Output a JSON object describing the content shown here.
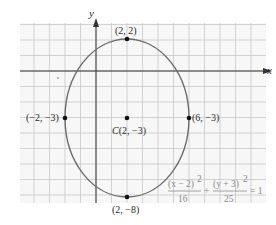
{
  "chart_data": {
    "type": "scatter",
    "title": "",
    "xlabel": "x",
    "ylabel": "y",
    "xlim": [
      -5,
      11
    ],
    "ylim": [
      -8.5,
      3
    ],
    "grid": true,
    "curve": {
      "kind": "ellipse",
      "center": [
        2,
        -3
      ],
      "a_horizontal": 4,
      "b_vertical": 5,
      "equation": "(x - 2)^2/16 + (y + 3)^2/25 = 1"
    },
    "points": [
      {
        "x": 2,
        "y": 2,
        "label": "(2, 2)"
      },
      {
        "x": -2,
        "y": -3,
        "label": "(−2, −3)"
      },
      {
        "x": 2,
        "y": -3,
        "label": "C(2, −3)"
      },
      {
        "x": 6,
        "y": -3,
        "label": "(6, −3)"
      },
      {
        "x": 2,
        "y": -8,
        "label": "(2, −8)"
      }
    ]
  },
  "labels": {
    "x_axis": "x",
    "y_axis": "y",
    "top_vertex": "(2, 2)",
    "left_vertex": "(−2, −3)",
    "right_vertex": "(6, −3)",
    "bottom_vertex": "(2, −8)",
    "center_prefix": "C",
    "center": "(2, −3)",
    "eq_num1": "(x − 2)",
    "eq_exp1": "2",
    "eq_den1": "16",
    "eq_plus": "+",
    "eq_num2": "(y + 3)",
    "eq_exp2": "2",
    "eq_den2": "25",
    "eq_rhs": "= 1"
  },
  "colors": {
    "grid": "#c8c8c8",
    "axis": "#333333",
    "ellipse": "#6b6b6b",
    "point": "#111111",
    "equation": "#8a8a8a"
  }
}
